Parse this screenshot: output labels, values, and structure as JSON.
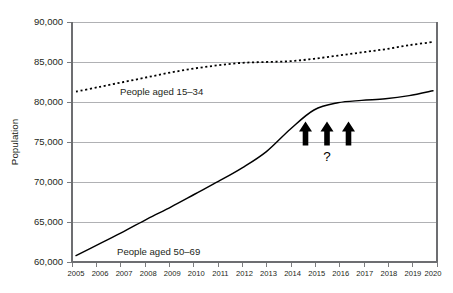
{
  "chart_data": {
    "type": "line",
    "title": "",
    "xlabel": "",
    "ylabel": "Population",
    "x": [
      2005,
      2006,
      2007,
      2008,
      2009,
      2010,
      2011,
      2012,
      2013,
      2014,
      2015,
      2016,
      2017,
      2018,
      2019,
      2020
    ],
    "xtick_labels": [
      "2005",
      "2006",
      "2007",
      "2008",
      "2009",
      "2010",
      "2011",
      "2012",
      "2013",
      "2014",
      "2015",
      "2016",
      "2017",
      "2018",
      "2019",
      "2020"
    ],
    "ylim": [
      60000,
      90000
    ],
    "yticks": [
      60000,
      65000,
      70000,
      75000,
      80000,
      85000,
      90000
    ],
    "ytick_labels": [
      "60,000",
      "65,000",
      "70,000",
      "75,000",
      "80,000",
      "85,000",
      "90,000"
    ],
    "grid": true,
    "legend_position": "inline-labels",
    "series": [
      {
        "name": "People aged 15–34",
        "style": "dotted",
        "color": "#000000",
        "values": [
          81300,
          81900,
          82500,
          83100,
          83700,
          84200,
          84600,
          84900,
          85000,
          85100,
          85400,
          85800,
          86200,
          86600,
          87100,
          87500
        ]
      },
      {
        "name": "People aged 50–69",
        "style": "solid",
        "color": "#000000",
        "values": [
          60800,
          62300,
          63800,
          65400,
          66900,
          68500,
          70100,
          71800,
          73800,
          76600,
          79000,
          79900,
          80200,
          80400,
          80800,
          81400
        ]
      }
    ],
    "annotations": [
      {
        "name": "arrow-1",
        "symbol": "up-arrow",
        "x": 2015,
        "y_top": 80400,
        "y_bottom": 77500
      },
      {
        "name": "arrow-2",
        "symbol": "up-arrow",
        "x": 2016,
        "y_top": 80400,
        "y_bottom": 77500
      },
      {
        "name": "arrow-3",
        "symbol": "up-arrow",
        "x": 2017,
        "y_top": 80400,
        "y_bottom": 77500
      },
      {
        "name": "question-mark",
        "symbol": "?",
        "text": "?",
        "x": 2016,
        "y": 76300
      }
    ]
  },
  "axes": {
    "y_title": "Population",
    "y_tick_labels": [
      "90,000",
      "85,000",
      "80,000",
      "75,000",
      "70,000",
      "65,000",
      "60,000"
    ],
    "x_tick_labels": [
      "2005",
      "2006",
      "2007",
      "2008",
      "2009",
      "2010",
      "2011",
      "2012",
      "2013",
      "2014",
      "2015",
      "2016",
      "2017",
      "2018",
      "2019",
      "2020"
    ]
  },
  "labels": {
    "series_upper": "People aged 15–34",
    "series_lower": "People aged 50–69",
    "question_mark": "?"
  },
  "colors": {
    "line": "#000000",
    "gridline": "#a7a9ac",
    "axis": "#6d6e71",
    "text": "#231f20",
    "background": "#ffffff"
  }
}
